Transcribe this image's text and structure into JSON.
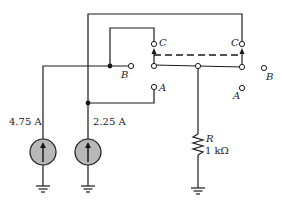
{
  "diagram": {
    "type": "circuit",
    "sources": [
      {
        "id": "I1",
        "label": "4.75 A",
        "kind": "current-source",
        "direction": "up"
      },
      {
        "id": "I2",
        "label": "2.25 A",
        "kind": "current-source",
        "direction": "up"
      }
    ],
    "resistor": {
      "name": "R",
      "value": "1 kΩ"
    },
    "switch_terminals": {
      "left": {
        "C": "C",
        "B": "B",
        "A": "A"
      },
      "right": {
        "C": "C",
        "B": "B",
        "A": "A"
      }
    },
    "colors": {
      "wire": "#1a1a1a",
      "source_fill": "#b8b8b8",
      "dashed_link": "#1a1a1a"
    }
  }
}
